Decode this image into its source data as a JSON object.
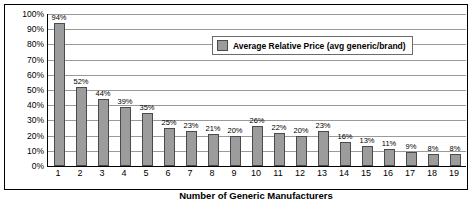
{
  "chart_data": {
    "type": "bar",
    "title": "",
    "xlabel": "Number of Generic Manufacturers",
    "ylabel": "Average Relative Price per Dose",
    "categories": [
      "1",
      "2",
      "3",
      "4",
      "5",
      "6",
      "7",
      "8",
      "9",
      "10",
      "11",
      "12",
      "13",
      "14",
      "15",
      "16",
      "17",
      "18",
      "19"
    ],
    "values": [
      94,
      52,
      44,
      39,
      35,
      25,
      23,
      21,
      20,
      26,
      22,
      20,
      23,
      16,
      13,
      11,
      9,
      8,
      8
    ],
    "data_labels": [
      "94%",
      "52%",
      "44%",
      "39%",
      "35%",
      "25%",
      "23%",
      "21%",
      "20%",
      "26%",
      "22%",
      "20%",
      "23%",
      "16%",
      "13%",
      "11%",
      "9%",
      "8%",
      "8%"
    ],
    "ylim": [
      0,
      100
    ],
    "ytick_labels": [
      "0%",
      "10%",
      "20%",
      "30%",
      "40%",
      "50%",
      "60%",
      "70%",
      "80%",
      "90%",
      "100%"
    ],
    "ytick_values": [
      0,
      10,
      20,
      30,
      40,
      50,
      60,
      70,
      80,
      90,
      100
    ],
    "grid": true,
    "legend_position": "top-right-inside",
    "series": [
      {
        "name": "Average Relative Price (avg generic/brand)",
        "color": "#9c9c9c",
        "values": [
          94,
          52,
          44,
          39,
          35,
          25,
          23,
          21,
          20,
          26,
          22,
          20,
          23,
          16,
          13,
          11,
          9,
          8,
          8
        ]
      }
    ]
  },
  "legend": {
    "label": "Average Relative Price (avg generic/brand)"
  }
}
